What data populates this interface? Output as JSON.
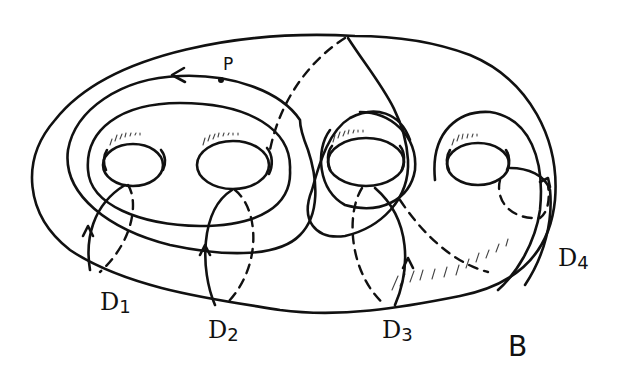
{
  "figure": {
    "point_label": "P",
    "panel_label": "B",
    "disks": [
      {
        "id": "D1",
        "letter": "D",
        "index": "1"
      },
      {
        "id": "D2",
        "letter": "D",
        "index": "2"
      },
      {
        "id": "D3",
        "letter": "D",
        "index": "3"
      },
      {
        "id": "D4",
        "letter": "D",
        "index": "4"
      }
    ],
    "holes": 4,
    "colors": {
      "ink": "#111111",
      "background": "#ffffff"
    }
  }
}
